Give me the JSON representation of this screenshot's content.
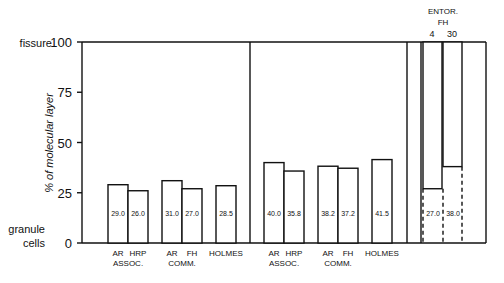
{
  "chart_data": {
    "type": "bar",
    "title": "",
    "ylabel": "% of molecular layer",
    "ylim": [
      0,
      100
    ],
    "yticks": [
      0,
      25,
      50,
      75,
      100
    ],
    "y_endpoint_labels": {
      "top": "fissure",
      "bottom": [
        "granule",
        "cells"
      ]
    },
    "grid": false,
    "legend": null,
    "panels": [
      {
        "name": "panel-1",
        "groups": [
          {
            "label": "ASSOC.",
            "bars": [
              {
                "label": "AR",
                "value": 29.0,
                "text": "29.0"
              },
              {
                "label": "HRP",
                "value": 26.0,
                "text": "26.0"
              }
            ]
          },
          {
            "label": "COMM.",
            "bars": [
              {
                "label": "AR",
                "value": 31.0,
                "text": "31.0"
              },
              {
                "label": "FH",
                "value": 27.0,
                "text": "27.0"
              }
            ]
          },
          {
            "label": "",
            "bars": [
              {
                "label": "HOLMES",
                "value": 28.5,
                "text": "28.5"
              }
            ]
          }
        ]
      },
      {
        "name": "panel-2",
        "groups": [
          {
            "label": "ASSOC.",
            "bars": [
              {
                "label": "AR",
                "value": 40.0,
                "text": "40.0"
              },
              {
                "label": "HRP",
                "value": 35.8,
                "text": "35.8"
              }
            ]
          },
          {
            "label": "COMM.",
            "bars": [
              {
                "label": "AR",
                "value": 38.2,
                "text": "38.2"
              },
              {
                "label": "FH",
                "value": 37.2,
                "text": "37.2"
              }
            ]
          },
          {
            "label": "",
            "bars": [
              {
                "label": "HOLMES",
                "value": 41.5,
                "text": "41.5"
              }
            ]
          }
        ]
      },
      {
        "name": "panel-entorhinal",
        "header": [
          "ENTOR.",
          "FH"
        ],
        "style": "inverted",
        "bars": [
          {
            "label": "4",
            "value": 27.0,
            "text": "27.0"
          },
          {
            "label": "30",
            "value": 38.0,
            "text": "38.0"
          }
        ]
      }
    ]
  }
}
